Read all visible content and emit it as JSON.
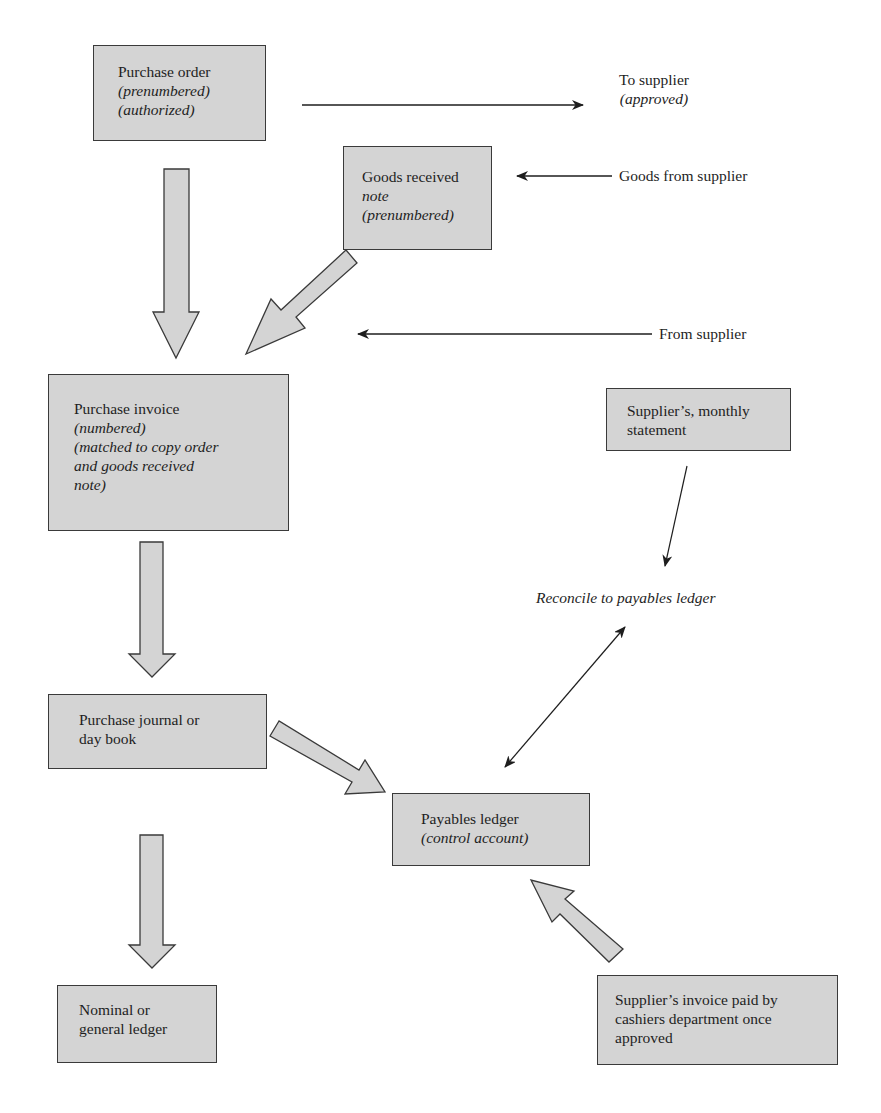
{
  "diagram": {
    "colors": {
      "box_fill": "#d4d4d4",
      "box_border": "#3a3a3a",
      "arrow_fill": "#d4d4d4",
      "line": "#1e1e1e",
      "background": "#ffffff"
    },
    "nodes": {
      "purchase_order": {
        "title": "Purchase order",
        "lines": [
          "(prenumbered)",
          "(authorized)"
        ]
      },
      "goods_received_note": {
        "title": "Goods received",
        "lines": [
          "note",
          "(prenumbered)"
        ]
      },
      "purchase_invoice": {
        "title": "Purchase invoice",
        "lines": [
          "(numbered)",
          "(matched to copy order",
          "and goods received",
          "note)"
        ]
      },
      "supplier_statement": {
        "title": "Supplier’s, monthly",
        "title2": "statement"
      },
      "purchase_journal": {
        "title": "Purchase journal or",
        "title2": "day book"
      },
      "payables_ledger": {
        "title": "Payables ledger",
        "lines": [
          "(control account)"
        ]
      },
      "nominal_ledger": {
        "title": "Nominal or",
        "title2": "general ledger"
      },
      "cashier_payment": {
        "title": "Supplier’s invoice paid by",
        "title2": "cashiers department once",
        "title3": "approved"
      }
    },
    "labels": {
      "to_supplier": "To supplier",
      "to_supplier_note": "(approved)",
      "goods_from_supplier": "Goods from supplier",
      "from_supplier": "From supplier",
      "reconcile": "Reconcile to payables ledger"
    },
    "edges": [
      {
        "from": "purchase_order",
        "to": "supplier",
        "type": "thin-arrow",
        "label": "To supplier (approved)"
      },
      {
        "from": "supplier",
        "to": "goods_received_note",
        "type": "thin-arrow",
        "label": "Goods from supplier"
      },
      {
        "from": "purchase_order",
        "to": "purchase_invoice",
        "type": "block-arrow"
      },
      {
        "from": "goods_received_note",
        "to": "purchase_invoice",
        "type": "block-arrow"
      },
      {
        "from": "supplier",
        "to": "purchase_invoice",
        "type": "thin-arrow",
        "label": "From supplier"
      },
      {
        "from": "purchase_invoice",
        "to": "purchase_journal",
        "type": "block-arrow"
      },
      {
        "from": "purchase_journal",
        "to": "payables_ledger",
        "type": "block-arrow"
      },
      {
        "from": "purchase_journal",
        "to": "nominal_ledger",
        "type": "block-arrow"
      },
      {
        "from": "supplier_statement",
        "to": "reconcile",
        "type": "thin-arrow"
      },
      {
        "from": "reconcile",
        "to": "payables_ledger",
        "type": "double-arrow"
      },
      {
        "from": "cashier_payment",
        "to": "payables_ledger",
        "type": "block-arrow"
      }
    ]
  }
}
